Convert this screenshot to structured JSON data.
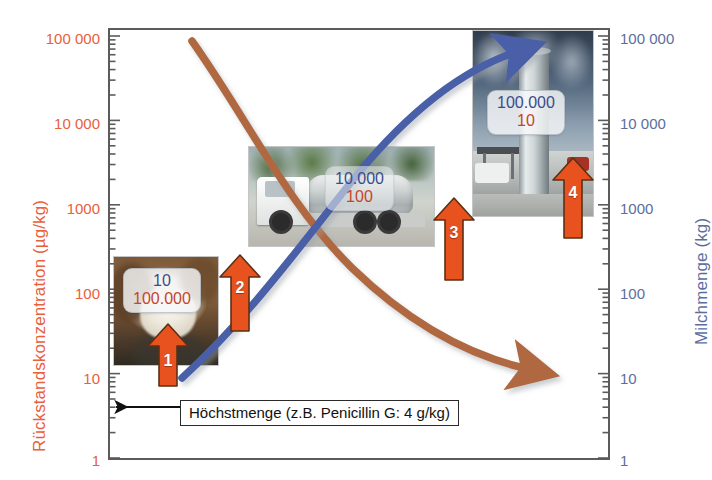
{
  "chart_data": {
    "type": "line",
    "title": "",
    "scale": "log",
    "axes": {
      "left": {
        "label": "Rückstandskonzentration (µg/kg)",
        "color": "#E9603C",
        "ticks": [
          "100 000",
          "10 000",
          "1000",
          "100",
          "10",
          "1"
        ],
        "values": [
          100000,
          10000,
          1000,
          100,
          10,
          1
        ],
        "range": [
          1,
          100000
        ]
      },
      "right": {
        "label": "Milchmenge (kg)",
        "color": "#5C6E9E",
        "ticks": [
          "100 000",
          "10 000",
          "1000",
          "100",
          "10",
          "1"
        ],
        "values": [
          100000,
          10000,
          1000,
          100,
          10,
          1
        ],
        "range": [
          1,
          100000
        ]
      },
      "x": {
        "label": "",
        "ticks": []
      }
    },
    "series": [
      {
        "name": "Rückstandskonzentration",
        "axis": "left",
        "color": "#B0683F",
        "direction": "decreasing",
        "points": [
          {
            "stage": 1,
            "value": 100000
          },
          {
            "stage": 2,
            "value": 100
          },
          {
            "stage": 3,
            "value": 10
          },
          {
            "stage": 4,
            "value": 10
          }
        ]
      },
      {
        "name": "Milchmenge",
        "axis": "right",
        "color": "#4A5FA8",
        "direction": "increasing",
        "points": [
          {
            "stage": 1,
            "value": 10
          },
          {
            "stage": 2,
            "value": 10000
          },
          {
            "stage": 3,
            "value": 100000
          },
          {
            "stage": 4,
            "value": 100000
          }
        ]
      }
    ],
    "annotations": [
      {
        "name": "maxlimit",
        "text": "Höchstmenge (z.B. Penicillin G: 4 g/kg)"
      }
    ],
    "stage_callouts": [
      {
        "stage": "cow",
        "milk": "10",
        "residue": "100.000"
      },
      {
        "stage": "truck",
        "milk": "10.000",
        "residue": "100"
      },
      {
        "stage": "silo",
        "milk": "100.000",
        "residue": "10"
      }
    ],
    "stage_markers": [
      "1",
      "2",
      "3",
      "4"
    ]
  },
  "axis_left": {
    "title": "Rückstandskonzentration (µg/kg)",
    "t0": "100 000",
    "t1": "10 000",
    "t2": "1000",
    "t3": "100",
    "t4": "10",
    "t5": "1"
  },
  "axis_right": {
    "title": "Milchmenge (kg)",
    "t0": "100 000",
    "t1": "10 000",
    "t2": "1000",
    "t3": "100",
    "t4": "10",
    "t5": "1"
  },
  "callouts": {
    "cow": {
      "milk": "10",
      "residue": "100.000"
    },
    "truck": {
      "milk": "10.000",
      "residue": "100"
    },
    "silo": {
      "milk": "100.000",
      "residue": "10"
    }
  },
  "markers": {
    "one": "1",
    "two": "2",
    "three": "3",
    "four": "4"
  },
  "annotation": {
    "maxlimit_text": "Höchstmenge (z.B. Penicillin G: 4 g/kg)"
  },
  "colors": {
    "residue_accent": "#E9603C",
    "milk_accent": "#5C6E9E",
    "residue_curve": "#B0683F",
    "milk_curve": "#4A5FA8",
    "marker_arrow": "#E8521E"
  }
}
